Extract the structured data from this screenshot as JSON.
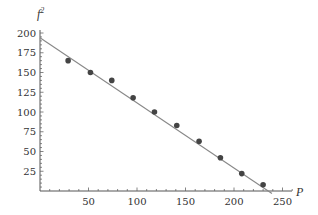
{
  "chart_data": {
    "type": "scatter",
    "title": "",
    "xlabel": "P",
    "ylabel": "f²",
    "xlim": [
      0,
      260
    ],
    "ylim": [
      0,
      200
    ],
    "x_ticks": [
      50,
      100,
      150,
      200,
      250
    ],
    "y_ticks": [
      25,
      50,
      75,
      100,
      125,
      150,
      175,
      200
    ],
    "grid": false,
    "legend": null,
    "series": [
      {
        "name": "data",
        "kind": "points",
        "color": "#444444",
        "points": [
          [
            29,
            165
          ],
          [
            52,
            150
          ],
          [
            74,
            140
          ],
          [
            96,
            118
          ],
          [
            118,
            100
          ],
          [
            141,
            83
          ],
          [
            164,
            63
          ],
          [
            186,
            42
          ],
          [
            208,
            22
          ],
          [
            230,
            8
          ]
        ]
      },
      {
        "name": "fit",
        "kind": "line",
        "color": "#888888",
        "intercept": 194,
        "slope": -0.822,
        "x_range": [
          0,
          236
        ]
      }
    ]
  },
  "labels": {
    "xlabel": "P",
    "ylabel_base": "f",
    "ylabel_sup": "2"
  }
}
